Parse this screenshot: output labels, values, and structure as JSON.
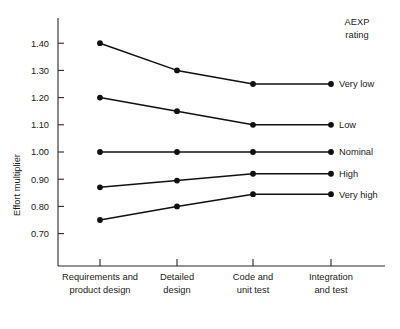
{
  "chart_data": {
    "type": "line",
    "title": "",
    "xlabel": "",
    "ylabel": "Effort multiplier",
    "legend_title": "AEXP rating",
    "legend_position": "right-of-plot",
    "grid": false,
    "categories": [
      "Requirements and product design",
      "Detailed design",
      "Code and unit test",
      "Integration and test"
    ],
    "category_lines": [
      [
        "Requirements and",
        "product design"
      ],
      [
        "Detailed",
        "design"
      ],
      [
        "Code and",
        "unit test"
      ],
      [
        "Integration",
        "and test"
      ]
    ],
    "ylim": [
      0.65,
      1.45
    ],
    "yticks": [
      0.7,
      0.8,
      0.9,
      1.0,
      1.1,
      1.2,
      1.3,
      1.4
    ],
    "ytick_labels": [
      "0.70",
      "0.80",
      "0.90",
      "1.00",
      "1.10",
      "1.20",
      "1.30",
      "1.40"
    ],
    "series": [
      {
        "name": "Very low",
        "values": [
          1.4,
          1.3,
          1.25,
          1.25
        ]
      },
      {
        "name": "Low",
        "values": [
          1.2,
          1.15,
          1.1,
          1.1
        ]
      },
      {
        "name": "Nominal",
        "values": [
          1.0,
          1.0,
          1.0,
          1.0
        ]
      },
      {
        "name": "High",
        "values": [
          0.87,
          0.895,
          0.92,
          0.92
        ]
      },
      {
        "name": "Very high",
        "values": [
          0.75,
          0.8,
          0.845,
          0.845
        ]
      }
    ],
    "colors": {
      "line": "#111111",
      "marker": "#111111",
      "axis": "#2a2a2a",
      "text": "#1a1a1a",
      "background": "#ffffff"
    }
  }
}
